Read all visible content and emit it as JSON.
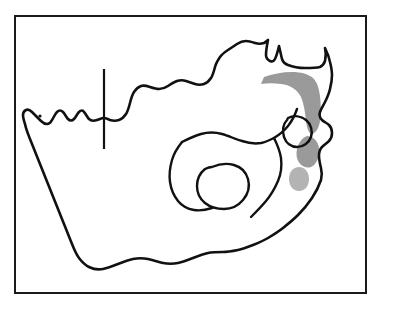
{
  "figure": {
    "type": "line-art outline map with shaded distribution areas",
    "background_color": "#ffffff",
    "frame": {
      "border_color": "#1a1a1a",
      "border_width_px": 2,
      "left_px": 14,
      "top_px": 15,
      "width_px": 353,
      "height_px": 279
    },
    "outline_color": "#111111",
    "shading_color_dark": "#9a9a9a",
    "shading_color_light": "#b3b3b3"
  },
  "map": {
    "country_name": "South Africa",
    "viewbox": "0 0 353 279",
    "outline": {
      "name": "south-africa-national-outline",
      "d": "M 263 55 L 261 62 L 256 68 L 248 71 L 240 72 L 232 74 L 226 79 L 221 86 L 219 93 L 214 98 L 208 101 L 203 107 L 199 114 L 197 122 L 191 126 L 184 127 L 177 126 L 170 123 L 163 122 L 156 124 L 150 127 L 143 128 L 136 126 L 130 122 L 124 119 L 118 120 L 112 124 L 106 128 L 100 130 L 94 129 L 90 127 L 87 126 L 84 127 L 79 130 L 74 133 L 69 135 L 64 136 L 58 136 L 53 134 L 49 131 L 45 133 L 42 138 L 39 142 L 34 144 L 29 143 L 24 140 L 19 136 L 14 133 L 10 131 L 7 130 L 5 131 L 6 136 L 9 144 L 13 153 L 17 161 L 22 170 L 27 178 L 31 186 L 35 194 L 38 202 L 41 210 L 44 218 L 48 226 L 52 233 L 57 239 L 62 244 L 68 247 L 74 249 L 80 250 L 86 249 L 92 247 L 98 246 L 104 247 L 110 249 L 116 250 L 122 249 L 128 246 L 134 243 L 140 241 L 146 240 L 152 240 L 158 241 L 164 242 L 170 241 L 176 239 L 182 236 L 188 232 L 194 228 L 200 223 L 206 218 L 212 213 L 218 208 L 224 203 L 230 198 L 236 193 L 242 187 L 248 181 L 254 175 L 260 169 L 266 163 L 272 157 L 277 150 L 282 143 L 287 136 L 292 129 L 296 122 L 300 115 L 304 108 L 307 101 L 310 94 L 312 87 L 313 80 L 312 73 L 309 67 L 305 62 L 300 58 L 295 55 L 290 53"
    },
    "shaded_areas": [
      {
        "name": "northeast-shaded-band",
        "label": "Limpopo / Mpumalanga lowveld escarpment band",
        "color": "#9a9a9a",
        "d": "M 250 72 L 258 69 L 267 67 L 276 66 L 285 66 L 292 68 L 296 72 L 299 78 L 301 86 L 302 95 L 302 104 L 301 112 L 298 118 L 294 119 L 291 114 L 290 105 L 290 96 L 289 88 L 286 82 L 281 78 L 274 76 L 266 76 L 258 77 L 251 78 Z"
      },
      {
        "name": "kwazulu-natal-coastal-shade-upper",
        "label": "KwaZulu-Natal coastal shaded patch (upper)",
        "color": "#9a9a9a",
        "d": "M 290 127 a 10 13 0 1 0 0.1 0 Z"
      },
      {
        "name": "kwazulu-natal-coastal-shade-lower",
        "label": "KwaZulu-Natal coastal shaded patch (lower)",
        "color": "#b3b3b3",
        "d": "M 283 149 a 8 10 0 1 0 0.1 0 Z"
      }
    ],
    "internal_boundaries": [
      {
        "name": "botswana-border-straight-segment",
        "label": "straight north-south border segment (Namibia/Botswana)",
        "d": "M 88 51 L 88 130"
      },
      {
        "name": "gauteng-northwest-boundary",
        "label": "North West / Free State / Gauteng boundary",
        "d": "M 169 122 L 176 119 L 184 116 L 192 115 L 200 116 L 208 119 L 216 122 L 223 124 L 230 125 L 237 125 L 244 124 L 250 122"
      },
      {
        "name": "free-state-boundary",
        "label": "Free State province boundary",
        "d": "M 170 123 L 165 129 L 161 136 L 158 144 L 157 152 L 157 160 L 159 168 L 162 175 L 166 181 L 171 185 L 177 187 L 184 188 L 191 188"
      },
      {
        "name": "eastern-cape-kzn-boundary",
        "label": "Eastern Cape / KwaZulu-Natal boundary",
        "d": "M 250 123 L 254 128 L 258 134 L 261 141 L 263 148 L 263 156 L 261 163 L 258 170 L 254 177 L 249 183 L 244 189 L 239 194"
      },
      {
        "name": "mpumalanga-kzn-boundary",
        "label": "Mpumalanga / KwaZulu-Natal boundary",
        "d": "M 250 122 L 257 119 L 263 115 L 268 110 L 272 104 L 275 98 L 277 92"
      }
    ],
    "enclaves": [
      {
        "name": "lesotho-outline",
        "label": "Lesotho",
        "d": "M 196 145 L 203 143 L 210 143 L 217 145 L 222 149 L 226 155 L 227 162 L 226 169 L 222 175 L 217 180 L 210 183 L 203 184 L 196 183 L 190 180 L 185 175 L 182 169 L 181 162 L 183 155 L 188 149 Z"
      },
      {
        "name": "eswatini-outline",
        "label": "Eswatini (Swaziland)",
        "d": "M 274 100 L 281 99 L 287 101 L 291 106 L 292 112 L 290 118 L 285 122 L 279 123 L 273 121 L 269 116 L 268 110 L 270 104 Z"
      }
    ],
    "marks": [
      {
        "name": "small-dot-northwest",
        "label": "small dot near Orange River mouth area",
        "cx": 24,
        "cy": 129,
        "r": 1.4,
        "color": "#111111"
      }
    ]
  }
}
